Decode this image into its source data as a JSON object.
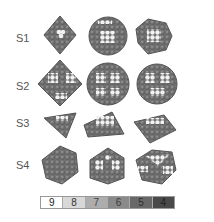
{
  "figure": {
    "rows": [
      {
        "label": "S1",
        "shapes": [
          "octahedron",
          "cuboctahedral-sphere",
          "truncated-octahedron"
        ]
      },
      {
        "label": "S2",
        "shapes": [
          "octahedron",
          "rounded-octahedron",
          "rounded-octahedron"
        ]
      },
      {
        "label": "S3",
        "shapes": [
          "triangular-plate",
          "triangular-plate",
          "triangular-plate"
        ]
      },
      {
        "label": "S4",
        "shapes": [
          "icosahedron",
          "decahedron",
          "truncated-tetrahedron"
        ]
      }
    ]
  },
  "legend": {
    "title": "coordination-number",
    "items": [
      {
        "label": "9",
        "color": "#ffffff",
        "text_color": "#222222"
      },
      {
        "label": "8",
        "color": "#d8d8d8",
        "text_color": "#333333"
      },
      {
        "label": "7",
        "color": "#adadad",
        "text_color": "#444444"
      },
      {
        "label": "6",
        "color": "#8a8a8a",
        "text_color": "#3a3a3a"
      },
      {
        "label": "5",
        "color": "#686868",
        "text_color": "#2e2e2e"
      },
      {
        "label": "4",
        "color": "#4a4a4a",
        "text_color": "#222222"
      }
    ]
  },
  "colors": {
    "atom_dark": "#6a6a6a",
    "atom_mid": "#8a8a8a",
    "atom_light": "#f4f4f4",
    "atom_edge": "#4c4c4c"
  }
}
